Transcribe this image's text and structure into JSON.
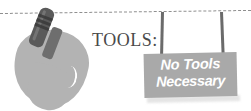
{
  "illustration": {
    "title": "tools-illustration",
    "label": "TOOLS:",
    "sign": {
      "line1": "No Tools",
      "line2": "Necessary"
    },
    "icons": {
      "trowel": "garden-trowel-icon",
      "dotted_line": "dashed-guide-line",
      "post_left": "sign-post-left",
      "post_right": "sign-post-right"
    },
    "colors": {
      "blade": "#b3b3b3",
      "handle": "#5a5a5a",
      "handle_grip": "#3a3a3a",
      "sign_background": "#a9a9a9",
      "sign_text": "#ffffff",
      "label_text": "#4a4a4a",
      "dotted_line": "#8f8f8f",
      "post": "#6b6b6b",
      "page_background": "#ffffff"
    }
  }
}
